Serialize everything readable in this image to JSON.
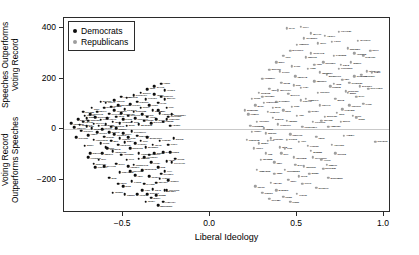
{
  "chart_data": {
    "type": "scatter",
    "title": "",
    "xlabel": "Liberal Ideology",
    "ylabel_upper_line1": "Speeches Outperforms",
    "ylabel_upper_line2": "Voting Record",
    "ylabel_lower_line1": "Voting Record",
    "ylabel_lower_line2": "Outperforms Speeches",
    "xlim": [
      -0.84,
      1.04
    ],
    "ylim": [
      -330,
      440
    ],
    "xticks": [
      -0.5,
      0.0,
      0.5,
      1.0
    ],
    "xticklabels": [
      "−0.5",
      "0.0",
      "0.5",
      "1.0"
    ],
    "yticks": [
      400,
      200,
      0,
      -200
    ],
    "yticklabels": [
      "400",
      "200",
      "0",
      "−200"
    ],
    "grid": false,
    "reference_line_y": 0,
    "legend_position": "top-left",
    "series": [
      {
        "name": "Democrats",
        "color": "#0d0d0d",
        "marker": "circle",
        "points": [
          [
            -0.8,
            25
          ],
          [
            -0.78,
            8
          ],
          [
            -0.76,
            40
          ],
          [
            -0.75,
            18
          ],
          [
            -0.74,
            -5
          ],
          [
            -0.73,
            30
          ],
          [
            -0.72,
            55
          ],
          [
            -0.71,
            12
          ],
          [
            -0.7,
            -22
          ],
          [
            -0.7,
            35
          ],
          [
            -0.69,
            60
          ],
          [
            -0.68,
            5
          ],
          [
            -0.67,
            -40
          ],
          [
            -0.67,
            22
          ],
          [
            -0.66,
            48
          ],
          [
            -0.65,
            -10
          ],
          [
            -0.65,
            70
          ],
          [
            -0.64,
            15
          ],
          [
            -0.63,
            -55
          ],
          [
            -0.63,
            38
          ],
          [
            -0.62,
            2
          ],
          [
            -0.61,
            -28
          ],
          [
            -0.61,
            85
          ],
          [
            -0.6,
            20
          ],
          [
            -0.6,
            -70
          ],
          [
            -0.59,
            45
          ],
          [
            -0.58,
            -12
          ],
          [
            -0.58,
            62
          ],
          [
            -0.57,
            -45
          ],
          [
            -0.57,
            10
          ],
          [
            -0.56,
            30
          ],
          [
            -0.56,
            -85
          ],
          [
            -0.55,
            75
          ],
          [
            -0.55,
            -20
          ],
          [
            -0.54,
            50
          ],
          [
            -0.54,
            5
          ],
          [
            -0.53,
            -60
          ],
          [
            -0.53,
            95
          ],
          [
            -0.52,
            -35
          ],
          [
            -0.52,
            25
          ],
          [
            -0.51,
            65
          ],
          [
            -0.51,
            -100
          ],
          [
            -0.5,
            40
          ],
          [
            -0.5,
            -15
          ],
          [
            -0.49,
            80
          ],
          [
            -0.49,
            -50
          ],
          [
            -0.48,
            15
          ],
          [
            -0.48,
            -120
          ],
          [
            -0.47,
            55
          ],
          [
            -0.47,
            -30
          ],
          [
            -0.46,
            100
          ],
          [
            -0.46,
            -75
          ],
          [
            -0.45,
            30
          ],
          [
            -0.45,
            -8
          ],
          [
            -0.44,
            70
          ],
          [
            -0.44,
            -140
          ],
          [
            -0.43,
            45
          ],
          [
            -0.43,
            -55
          ],
          [
            -0.42,
            110
          ],
          [
            -0.42,
            -25
          ],
          [
            -0.41,
            20
          ],
          [
            -0.41,
            -95
          ],
          [
            -0.4,
            85
          ],
          [
            -0.4,
            -45
          ],
          [
            -0.39,
            60
          ],
          [
            -0.39,
            -160
          ],
          [
            -0.38,
            35
          ],
          [
            -0.38,
            -110
          ],
          [
            -0.37,
            120
          ],
          [
            -0.37,
            -70
          ],
          [
            -0.36,
            50
          ],
          [
            -0.36,
            -30
          ],
          [
            -0.35,
            95
          ],
          [
            -0.35,
            -185
          ],
          [
            -0.34,
            25
          ],
          [
            -0.34,
            -130
          ],
          [
            -0.33,
            75
          ],
          [
            -0.33,
            -60
          ],
          [
            -0.32,
            140
          ],
          [
            -0.32,
            -95
          ],
          [
            -0.31,
            40
          ],
          [
            -0.31,
            -210
          ],
          [
            -0.3,
            105
          ],
          [
            -0.3,
            -150
          ],
          [
            -0.29,
            65
          ],
          [
            -0.29,
            -45
          ],
          [
            -0.28,
            130
          ],
          [
            -0.28,
            -175
          ],
          [
            -0.27,
            30
          ],
          [
            -0.27,
            -90
          ],
          [
            -0.26,
            155
          ],
          [
            -0.26,
            -240
          ],
          [
            -0.25,
            85
          ],
          [
            -0.25,
            -125
          ],
          [
            -0.24,
            50
          ],
          [
            -0.24,
            -200
          ],
          [
            -0.7,
            -110
          ],
          [
            -0.66,
            -150
          ],
          [
            -0.62,
            -95
          ],
          [
            -0.58,
            -190
          ],
          [
            -0.54,
            -135
          ],
          [
            -0.5,
            -225
          ],
          [
            -0.46,
            -165
          ],
          [
            -0.42,
            -255
          ],
          [
            -0.38,
            -215
          ],
          [
            -0.34,
            -270
          ],
          [
            -0.6,
            105
          ],
          [
            -0.55,
            115
          ],
          [
            -0.48,
            125
          ],
          [
            -0.44,
            135
          ],
          [
            -0.4,
            145
          ],
          [
            -0.36,
            160
          ],
          [
            -0.32,
            170
          ],
          [
            -0.28,
            180
          ],
          [
            -0.26,
            120
          ],
          [
            -0.3,
            75
          ],
          [
            -0.72,
            -65
          ],
          [
            -0.68,
            85
          ],
          [
            -0.64,
            -120
          ],
          [
            -0.59,
            -75
          ],
          [
            -0.52,
            -170
          ],
          [
            -0.45,
            -205
          ],
          [
            -0.39,
            -240
          ],
          [
            -0.35,
            -100
          ],
          [
            -0.31,
            -260
          ],
          [
            -0.27,
            -285
          ],
          [
            -0.24,
            -60
          ],
          [
            -0.25,
            40
          ],
          [
            -0.23,
            15
          ],
          [
            -0.22,
            -130
          ],
          [
            -0.21,
            -35
          ],
          [
            -0.77,
            -30
          ],
          [
            -0.73,
            70
          ],
          [
            -0.69,
            -95
          ],
          [
            -0.61,
            -145
          ],
          [
            -0.57,
            90
          ],
          [
            -0.53,
            -215
          ],
          [
            -0.49,
            -255
          ],
          [
            -0.43,
            -180
          ],
          [
            -0.37,
            -285
          ],
          [
            -0.33,
            -235
          ],
          [
            -0.29,
            -195
          ],
          [
            -0.26,
            -165
          ],
          [
            -0.23,
            -90
          ],
          [
            -0.22,
            60
          ],
          [
            -0.2,
            -115
          ],
          [
            -0.71,
            45
          ],
          [
            -0.67,
            -135
          ],
          [
            -0.63,
            110
          ],
          [
            -0.56,
            -250
          ],
          [
            -0.51,
            130
          ],
          [
            -0.47,
            -145
          ],
          [
            -0.41,
            -115
          ],
          [
            -0.36,
            -255
          ],
          [
            -0.3,
            -300
          ],
          [
            -0.25,
            -240
          ]
        ]
      },
      {
        "name": "Republicans",
        "color": "#9d9d9d",
        "marker": "circle",
        "points": [
          [
            0.22,
            60
          ],
          [
            0.24,
            -10
          ],
          [
            0.26,
            95
          ],
          [
            0.27,
            30
          ],
          [
            0.28,
            -55
          ],
          [
            0.3,
            130
          ],
          [
            0.31,
            5
          ],
          [
            0.32,
            -95
          ],
          [
            0.33,
            70
          ],
          [
            0.34,
            160
          ],
          [
            0.35,
            -35
          ],
          [
            0.36,
            45
          ],
          [
            0.37,
            -130
          ],
          [
            0.38,
            110
          ],
          [
            0.39,
            20
          ],
          [
            0.4,
            -70
          ],
          [
            0.41,
            185
          ],
          [
            0.42,
            75
          ],
          [
            0.43,
            -160
          ],
          [
            0.44,
            35
          ],
          [
            0.45,
            140
          ],
          [
            0.46,
            -20
          ],
          [
            0.47,
            90
          ],
          [
            0.48,
            -110
          ],
          [
            0.49,
            210
          ],
          [
            0.5,
            55
          ],
          [
            0.51,
            -50
          ],
          [
            0.52,
            165
          ],
          [
            0.53,
            10
          ],
          [
            0.54,
            -145
          ],
          [
            0.55,
            120
          ],
          [
            0.56,
            240
          ],
          [
            0.57,
            70
          ],
          [
            0.58,
            -85
          ],
          [
            0.59,
            30
          ],
          [
            0.6,
            190
          ],
          [
            0.61,
            -30
          ],
          [
            0.62,
            145
          ],
          [
            0.63,
            95
          ],
          [
            0.64,
            -120
          ],
          [
            0.65,
            265
          ],
          [
            0.66,
            50
          ],
          [
            0.67,
            215
          ],
          [
            0.68,
            10
          ],
          [
            0.69,
            170
          ],
          [
            0.7,
            -60
          ],
          [
            0.71,
            290
          ],
          [
            0.72,
            120
          ],
          [
            0.73,
            65
          ],
          [
            0.74,
            240
          ],
          [
            0.75,
            30
          ],
          [
            0.76,
            195
          ],
          [
            0.77,
            -25
          ],
          [
            0.78,
            150
          ],
          [
            0.79,
            320
          ],
          [
            0.8,
            95
          ],
          [
            0.81,
            265
          ],
          [
            0.82,
            55
          ],
          [
            0.83,
            210
          ],
          [
            0.84,
            130
          ],
          [
            0.85,
            350
          ],
          [
            0.86,
            170
          ],
          [
            0.88,
            290
          ],
          [
            0.9,
            230
          ],
          [
            0.92,
            310
          ],
          [
            0.95,
            -50
          ],
          [
            0.25,
            -75
          ],
          [
            0.29,
            -120
          ],
          [
            0.33,
            -45
          ],
          [
            0.37,
            -175
          ],
          [
            0.41,
            -95
          ],
          [
            0.45,
            -200
          ],
          [
            0.49,
            -140
          ],
          [
            0.53,
            -215
          ],
          [
            0.57,
            -175
          ],
          [
            0.61,
            -230
          ],
          [
            0.65,
            -155
          ],
          [
            0.68,
            -190
          ],
          [
            0.3,
            200
          ],
          [
            0.34,
            235
          ],
          [
            0.38,
            265
          ],
          [
            0.42,
            290
          ],
          [
            0.46,
            310
          ],
          [
            0.5,
            335
          ],
          [
            0.54,
            360
          ],
          [
            0.58,
            380
          ],
          [
            0.62,
            340
          ],
          [
            0.66,
            370
          ],
          [
            0.7,
            345
          ],
          [
            0.74,
            385
          ],
          [
            0.23,
            15
          ],
          [
            0.27,
            -160
          ],
          [
            0.31,
            105
          ],
          [
            0.35,
            -210
          ],
          [
            0.39,
            155
          ],
          [
            0.43,
            -75
          ],
          [
            0.47,
            250
          ],
          [
            0.51,
            -185
          ],
          [
            0.55,
            285
          ],
          [
            0.59,
            -110
          ],
          [
            0.63,
            225
          ],
          [
            0.67,
            -140
          ],
          [
            0.71,
            180
          ],
          [
            0.75,
            255
          ],
          [
            0.79,
            145
          ],
          [
            0.83,
            300
          ],
          [
            0.87,
            215
          ],
          [
            0.91,
            160
          ],
          [
            0.26,
            -225
          ],
          [
            0.3,
            -250
          ],
          [
            0.34,
            -275
          ],
          [
            0.38,
            -240
          ],
          [
            0.42,
            -265
          ],
          [
            0.46,
            -285
          ],
          [
            0.5,
            -255
          ],
          [
            0.28,
            145
          ],
          [
            0.32,
            -15
          ],
          [
            0.36,
            85
          ],
          [
            0.4,
            230
          ],
          [
            0.44,
            -40
          ],
          [
            0.48,
            175
          ],
          [
            0.52,
            115
          ],
          [
            0.56,
            -65
          ],
          [
            0.6,
            255
          ],
          [
            0.64,
            35
          ],
          [
            0.72,
            -95
          ],
          [
            0.76,
            80
          ],
          [
            0.8,
            185
          ],
          [
            0.84,
            45
          ],
          [
            0.44,
            400
          ],
          [
            0.52,
            405
          ],
          [
            0.58,
            300
          ],
          [
            0.2,
            75
          ],
          [
            0.21,
            -40
          ],
          [
            0.24,
            120
          ],
          [
            0.88,
            100
          ],
          [
            0.93,
            225
          ]
        ]
      }
    ]
  },
  "legend": {
    "items": [
      {
        "label": "Democrats",
        "color": "#0d0d0d"
      },
      {
        "label": "Republicans",
        "color": "#9d9d9d"
      }
    ]
  }
}
